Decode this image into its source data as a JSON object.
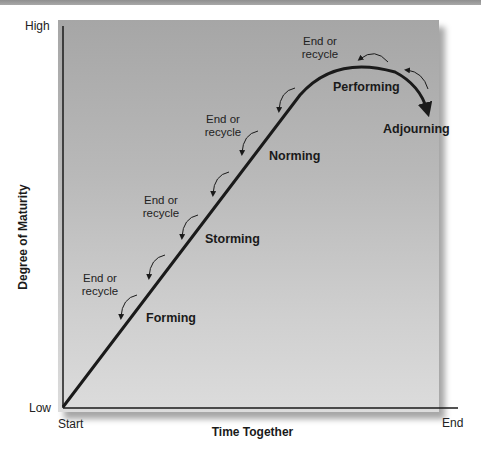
{
  "diagram": {
    "y_axis": {
      "label": "Degree of Maturity",
      "high": "High",
      "low": "Low"
    },
    "x_axis": {
      "label": "Time Together",
      "start": "Start",
      "end": "End"
    },
    "stages": [
      {
        "name": "Forming"
      },
      {
        "name": "Storming"
      },
      {
        "name": "Norming"
      },
      {
        "name": "Performing"
      },
      {
        "name": "Adjourning"
      }
    ],
    "exit_labels": [
      {
        "line1": "End or",
        "line2": "recycle"
      },
      {
        "line1": "End or",
        "line2": "recycle"
      },
      {
        "line1": "End or",
        "line2": "recycle"
      },
      {
        "line1": "End or",
        "line2": "recycle"
      }
    ],
    "colors": {
      "panel_top": "#a6a6a6",
      "panel_bottom": "#dcdcdc",
      "line": "#1a1a1a",
      "text": "#222222"
    }
  }
}
